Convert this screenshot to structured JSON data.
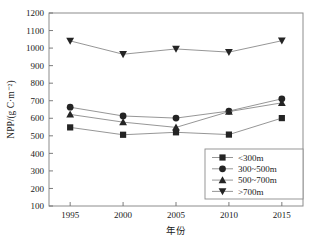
{
  "chart_data": {
    "type": "line",
    "title": "",
    "xlabel": "年份",
    "ylabel": "NPP/(g C·m⁻²)",
    "x": [
      1995,
      2000,
      2005,
      2010,
      2015
    ],
    "xticklabels": [
      "1995",
      "2000",
      "2005",
      "2010",
      "2015"
    ],
    "yticklabels": [
      "100",
      "200",
      "300",
      "400",
      "500",
      "600",
      "700",
      "800",
      "900",
      "1000",
      "1100",
      "1200"
    ],
    "yticks": [
      100,
      200,
      300,
      400,
      500,
      600,
      700,
      800,
      900,
      1000,
      1100,
      1200
    ],
    "ylim": [
      100,
      1200
    ],
    "xlim": [
      1993,
      2017
    ],
    "grid": false,
    "legend_position": "lower-right",
    "series": [
      {
        "name": "<300m",
        "marker": "square",
        "color": "#242424",
        "values": [
          548,
          506,
          520,
          507,
          601
        ]
      },
      {
        "name": "300~500m",
        "marker": "circle",
        "color": "#242424",
        "values": [
          663,
          613,
          601,
          641,
          711
        ]
      },
      {
        "name": "500~700m",
        "marker": "triangle-up",
        "color": "#242424",
        "values": [
          622,
          578,
          548,
          638,
          688
        ]
      },
      {
        "name": ">700m",
        "marker": "triangle-down",
        "color": "#242424",
        "values": [
          1041,
          965,
          995,
          977,
          1042
        ]
      }
    ]
  },
  "legend": {
    "items": [
      {
        "label": "<300m",
        "marker": "square"
      },
      {
        "label": "300~500m",
        "marker": "circle"
      },
      {
        "label": "500~700m",
        "marker": "triangle-up"
      },
      {
        "label": ">700m",
        "marker": "triangle-down"
      }
    ]
  },
  "axes": {
    "y_title": "NPP/(g C·m⁻²)",
    "x_title": "年份"
  }
}
